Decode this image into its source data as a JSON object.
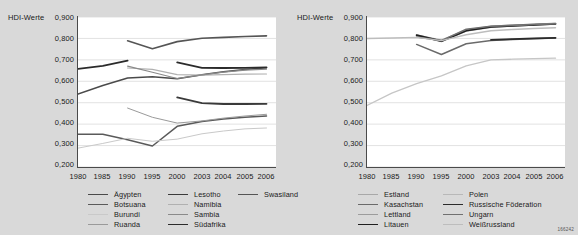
{
  "figure": {
    "code": "166242",
    "background": "#d9d9d9",
    "plot_background": "#ffffff"
  },
  "chart_data": [
    {
      "type": "line",
      "title": "",
      "ylabel": "HDI-Werte",
      "xlabel": "",
      "grid": true,
      "legend_position": "bottom",
      "x": [
        "1980",
        "1985",
        "1990",
        "1995",
        "2000",
        "2003",
        "2004",
        "2005",
        "2006"
      ],
      "ylim": [
        0.2,
        0.9
      ],
      "yticks": [
        "0,200",
        "0,300",
        "0,400",
        "0,500",
        "0,600",
        "0,700",
        "0,800",
        "0,900"
      ],
      "series": [
        {
          "name": "Ägypten",
          "color": "#4a4a4a",
          "width": 1.5,
          "values": [
            0.54,
            0.58,
            0.615,
            0.621,
            0.612,
            0.63,
            0.645,
            0.655,
            0.663
          ]
        },
        {
          "name": "Botsuana",
          "color": "#5a5a5a",
          "width": 1.5,
          "values": [
            0.353,
            0.353,
            0.327,
            0.298,
            0.39,
            0.412,
            0.424,
            0.432,
            0.438
          ]
        },
        {
          "name": "Burundi",
          "color": "#c9c9c9",
          "width": 1.0,
          "values": [
            0.288,
            0.31,
            0.334,
            0.32,
            0.33,
            0.355,
            0.368,
            0.378,
            0.382
          ]
        },
        {
          "name": "Ruanda",
          "color": "#9a9a9a",
          "width": 1.0,
          "values": [
            null,
            null,
            0.475,
            0.432,
            0.405,
            0.415,
            0.428,
            0.438,
            0.446
          ]
        },
        {
          "name": "Lesotho",
          "color": "#3a3a3a",
          "width": 1.8,
          "values": [
            null,
            null,
            null,
            null,
            0.525,
            0.498,
            0.494,
            0.494,
            0.495
          ]
        },
        {
          "name": "Namibia",
          "color": "#b0b0b0",
          "width": 1.2,
          "values": [
            null,
            null,
            0.662,
            0.656,
            0.631,
            0.629,
            0.631,
            0.633,
            0.634
          ]
        },
        {
          "name": "Sambia",
          "color": "#8a8a8a",
          "width": 1.2,
          "values": [
            null,
            null,
            0.671,
            0.642,
            0.613,
            0.63,
            0.643,
            0.652,
            0.657
          ]
        },
        {
          "name": "Südafrika",
          "color": "#2b2b2b",
          "width": 1.8,
          "values": [
            0.658,
            0.672,
            0.696,
            null,
            0.688,
            0.663,
            0.662,
            0.663,
            0.665
          ]
        },
        {
          "name": "Swasiland",
          "color": "#555555",
          "width": 1.6,
          "values": [
            null,
            null,
            0.789,
            0.752,
            0.785,
            0.801,
            0.805,
            0.809,
            0.812
          ]
        }
      ]
    },
    {
      "type": "line",
      "title": "",
      "ylabel": "HDI-Werte",
      "xlabel": "",
      "grid": true,
      "legend_position": "bottom",
      "x": [
        "1980",
        "1985",
        "1990",
        "1995",
        "2000",
        "2003",
        "2004",
        "2005",
        "2006"
      ],
      "ylim": [
        0.2,
        0.9
      ],
      "yticks": [
        "0,200",
        "0,300",
        "0,400",
        "0,500",
        "0,600",
        "0,700",
        "0,800",
        "0,900"
      ],
      "series": [
        {
          "name": "Estland",
          "color": "#a8a8a8",
          "width": 1.2,
          "values": [
            null,
            null,
            0.817,
            0.792,
            0.84,
            0.858,
            0.862,
            0.866,
            0.871
          ]
        },
        {
          "name": "Kasachstan",
          "color": "#6a6a6a",
          "width": 1.5,
          "values": [
            null,
            null,
            0.772,
            0.725,
            0.775,
            0.79,
            0.795,
            0.799,
            0.802
          ]
        },
        {
          "name": "Lettland",
          "color": "#9c9c9c",
          "width": 1.2,
          "values": [
            null,
            null,
            0.813,
            0.785,
            0.834,
            0.852,
            0.857,
            0.862,
            0.867
          ]
        },
        {
          "name": "Litauen",
          "color": "#1f1f1f",
          "width": 1.8,
          "values": [
            null,
            null,
            0.815,
            0.787,
            0.836,
            0.854,
            0.859,
            0.863,
            0.868
          ]
        },
        {
          "name": "Polen",
          "color": "#b8b8b8",
          "width": 1.2,
          "values": [
            null,
            null,
            null,
            null,
            null,
            0.858,
            0.861,
            0.865,
            0.87
          ]
        },
        {
          "name": "Russische Föderation",
          "color": "#2b2b2b",
          "width": 1.8,
          "values": [
            null,
            null,
            null,
            null,
            null,
            0.793,
            0.797,
            0.8,
            0.803
          ]
        },
        {
          "name": "Ungarn",
          "color": "#707070",
          "width": 1.5,
          "values": [
            null,
            null,
            0.807,
            0.79,
            0.843,
            0.857,
            0.862,
            0.866,
            0.869
          ]
        },
        {
          "name": "Weißrussland",
          "color": "#bdbdbd",
          "width": 1.4,
          "values": [
            0.8,
            0.802,
            0.805,
            0.79,
            0.817,
            0.836,
            0.842,
            0.846,
            0.85
          ]
        }
      ]
    },
    {
      "type": "line",
      "note": "pale low trajectory visible on right panel (rising from ~0.49 in 1980 to ~0.71 by 2003)",
      "color": "#c6c6c6",
      "x": [
        "1980",
        "1985",
        "1990",
        "1995",
        "2000",
        "2003",
        "2004",
        "2005",
        "2006"
      ],
      "values": [
        0.487,
        0.545,
        0.589,
        0.625,
        0.672,
        0.7,
        0.703,
        0.706,
        0.708
      ]
    }
  ],
  "left_chart": {
    "ylabel": "HDI-Werte",
    "yticks": [
      "0,900",
      "0,800",
      "0,700",
      "0,600",
      "0,500",
      "0,400",
      "0,300",
      "0,200"
    ],
    "xticks": [
      "1980",
      "1985",
      "1990",
      "1995",
      "2000",
      "2003",
      "2004",
      "2005",
      "2006"
    ],
    "legend": {
      "col1": [
        "Ägypten",
        "Botsuana",
        "Burundi",
        "Ruanda"
      ],
      "col2": [
        "Lesotho",
        "Namibia",
        "Sambia",
        "Südafrika"
      ],
      "col3": [
        "Swasiland"
      ]
    }
  },
  "right_chart": {
    "ylabel": "HDI-Werte",
    "yticks": [
      "0,900",
      "0,800",
      "0,700",
      "0,600",
      "0,500",
      "0,400",
      "0,300",
      "0,200"
    ],
    "xticks": [
      "1980",
      "1985",
      "1990",
      "1995",
      "2000",
      "2003",
      "2004",
      "2005",
      "2006"
    ],
    "legend": {
      "col1": [
        "Estland",
        "Kasachstan",
        "Lettland",
        "Litauen"
      ],
      "col2": [
        "Polen",
        "Russische Föderation",
        "Ungarn",
        "Weißrussland"
      ]
    }
  }
}
